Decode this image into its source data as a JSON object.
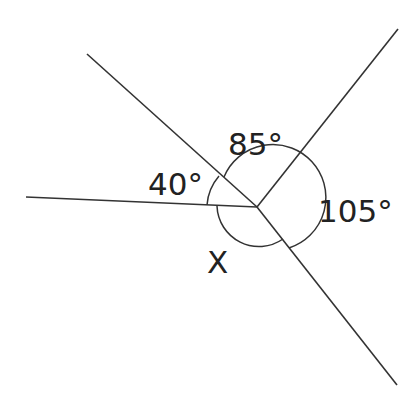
{
  "diagram": {
    "type": "angles-around-a-point",
    "center": [
      257,
      207
    ],
    "rays": [
      {
        "name": "ray-upper-left",
        "end": [
          87,
          54
        ]
      },
      {
        "name": "ray-upper-right",
        "end": [
          398,
          29
        ]
      },
      {
        "name": "ray-left",
        "end": [
          26,
          197
        ]
      },
      {
        "name": "ray-lower-right",
        "end": [
          397,
          385
        ]
      }
    ],
    "labels": {
      "angle_40": "40°",
      "angle_85": "85°",
      "angle_105": "105°",
      "angle_x": "X"
    },
    "colors": {
      "stroke": "#333333",
      "text": "#222222",
      "background": "#ffffff"
    }
  }
}
